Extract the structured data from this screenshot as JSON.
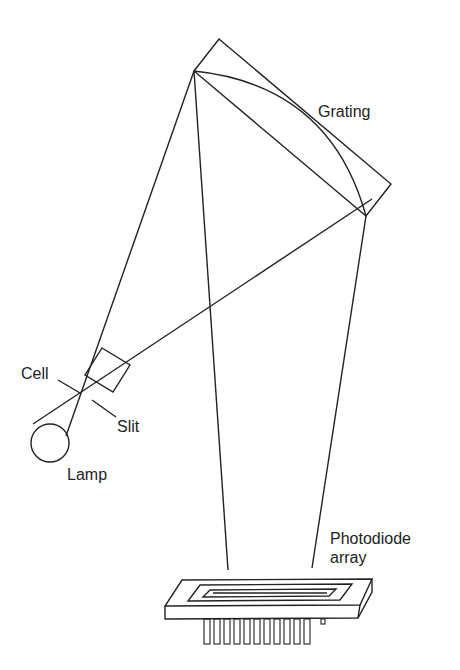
{
  "diagram": {
    "labels": {
      "grating": "Grating",
      "cell": "Cell",
      "slit": "Slit",
      "lamp": "Lamp",
      "photodiode_line1": "Photodiode",
      "photodiode_line2": "array"
    },
    "colors": {
      "stroke": "#222222",
      "background": "#ffffff"
    }
  }
}
